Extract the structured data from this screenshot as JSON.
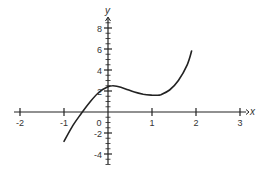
{
  "chart_data": {
    "type": "line",
    "title": "",
    "xlabel": "x",
    "ylabel": "y",
    "xlim": [
      -2,
      3
    ],
    "ylim": [
      -5,
      9
    ],
    "x_ticks": [
      -2,
      -1,
      0,
      1,
      2,
      3
    ],
    "x_tick_labels": [
      "-2",
      "-1",
      "0",
      "1",
      "2",
      "3"
    ],
    "y_ticks": [
      -4,
      -2,
      2,
      4,
      6,
      8
    ],
    "y_tick_labels": [
      "-4",
      "-2",
      "2",
      "4",
      "6",
      "8"
    ],
    "y_minor_tick_step": 0.5,
    "grid": false,
    "legend": null,
    "series": [
      {
        "name": "f(x)",
        "color": "#222222",
        "x": [
          -1.0,
          -0.8,
          -0.6,
          -0.4,
          -0.2,
          0.0,
          0.1,
          0.2,
          0.4,
          0.6,
          0.8,
          1.0,
          1.1,
          1.2,
          1.4,
          1.6,
          1.8,
          1.9
        ],
        "y": [
          -2.8,
          -1.3,
          -0.1,
          1.0,
          1.9,
          2.4,
          2.5,
          2.45,
          2.2,
          1.9,
          1.7,
          1.6,
          1.6,
          1.65,
          2.1,
          3.0,
          4.5,
          5.8
        ]
      }
    ],
    "features": {
      "x_intercept": -0.6,
      "local_max": [
        0.1,
        2.5
      ],
      "local_min": [
        1.1,
        1.6
      ]
    }
  },
  "labels": {
    "x_axis": "x",
    "y_axis": "y",
    "origin": "0"
  }
}
